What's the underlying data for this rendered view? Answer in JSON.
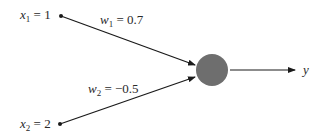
{
  "diagram": {
    "type": "perceptron",
    "inputs": [
      {
        "var": "x",
        "sub": "1",
        "eq": " = ",
        "value": "1"
      },
      {
        "var": "x",
        "sub": "2",
        "eq": " = ",
        "value": "2"
      }
    ],
    "weights": [
      {
        "var": "w",
        "sub": "1",
        "eq": " = ",
        "value": "0.7"
      },
      {
        "var": "w",
        "sub": "2",
        "eq": " = ",
        "value": "−0.5"
      }
    ],
    "output": {
      "var": "y"
    },
    "colors": {
      "node_fill": "#6e6e6e",
      "line": "#1a1a1a",
      "text": "#2a2a2a"
    }
  }
}
